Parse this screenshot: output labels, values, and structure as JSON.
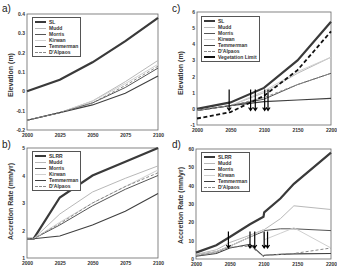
{
  "chart_data": [
    {
      "panel": "a)",
      "type": "line",
      "ylabel": "Elevation (m)",
      "xlim": [
        2000,
        2100
      ],
      "ylim": [
        -0.2,
        0.4
      ],
      "xticks": [
        "2000",
        "2025",
        "2050",
        "2075",
        "2100"
      ],
      "yticks": [
        "0.4",
        "0.3",
        "0.2",
        "0.1",
        "0",
        "-0.1",
        "-0.2"
      ],
      "legend": [
        "SL",
        "Mudd",
        "Morris",
        "Kirwan",
        "Temmerman",
        "D'Alpaos"
      ],
      "x": [
        2000,
        2025,
        2050,
        2075,
        2100
      ],
      "series": [
        {
          "name": "SL",
          "values": [
            0.0,
            0.06,
            0.15,
            0.26,
            0.38
          ]
        },
        {
          "name": "Mudd",
          "values": [
            -0.15,
            -0.11,
            -0.05,
            0.05,
            0.16
          ]
        },
        {
          "name": "Morris",
          "values": [
            -0.15,
            -0.11,
            -0.06,
            0.02,
            0.12
          ]
        },
        {
          "name": "Kirwan",
          "values": [
            -0.15,
            -0.11,
            -0.05,
            0.04,
            0.14
          ]
        },
        {
          "name": "Temmerman",
          "values": [
            -0.15,
            -0.11,
            -0.07,
            -0.01,
            0.08
          ]
        },
        {
          "name": "D'Alpaos",
          "values": [
            -0.15,
            -0.11,
            -0.06,
            0.03,
            0.13
          ]
        }
      ]
    },
    {
      "panel": "b)",
      "type": "line",
      "ylabel": "Accretion Rate (mm/yr)",
      "xlim": [
        2000,
        2100
      ],
      "ylim": [
        1,
        5
      ],
      "xticks": [
        "2000",
        "2025",
        "2050",
        "2075",
        "2100"
      ],
      "yticks": [
        "5",
        "4",
        "3",
        "2",
        "1"
      ],
      "legend": [
        "SLRR",
        "Mudd",
        "Morris",
        "Kirwan",
        "Temmerman",
        "D'Alpaos"
      ],
      "x": [
        2000,
        2005,
        2025,
        2050,
        2075,
        2100
      ],
      "series": [
        {
          "name": "SLRR",
          "values": [
            1.7,
            1.7,
            3.2,
            4.0,
            4.5,
            5.0
          ]
        },
        {
          "name": "Mudd",
          "values": [
            1.7,
            1.7,
            2.6,
            3.4,
            3.9,
            4.35
          ]
        },
        {
          "name": "Morris",
          "values": [
            1.7,
            1.7,
            2.2,
            2.9,
            3.5,
            4.0
          ]
        },
        {
          "name": "Kirwan",
          "values": [
            1.7,
            1.7,
            2.3,
            3.0,
            3.6,
            4.2
          ]
        },
        {
          "name": "Temmerman",
          "values": [
            1.7,
            1.7,
            1.8,
            2.2,
            2.7,
            3.35
          ]
        },
        {
          "name": "D'Alpaos",
          "values": [
            1.7,
            1.7,
            2.25,
            3.0,
            3.6,
            4.1
          ]
        }
      ]
    },
    {
      "panel": "c)",
      "type": "line",
      "ylabel": "Elevation (m)",
      "xlim": [
        2000,
        2200
      ],
      "ylim": [
        -1,
        6
      ],
      "xticks": [
        "2000",
        "2050",
        "2100",
        "2150",
        "2200"
      ],
      "yticks": [
        "6",
        "5",
        "4",
        "3",
        "2",
        "1",
        "0",
        "-1"
      ],
      "legend": [
        "SL",
        "Mudd",
        "Morris",
        "Kirwan",
        "Temmerman",
        "D'Alpaos",
        "Vegetation Limit"
      ],
      "x": [
        2000,
        2050,
        2100,
        2150,
        2200
      ],
      "series": [
        {
          "name": "SL",
          "values": [
            0.0,
            0.4,
            1.3,
            3.0,
            5.4
          ]
        },
        {
          "name": "Mudd",
          "values": [
            -0.1,
            0.2,
            1.0,
            2.2,
            3.2
          ]
        },
        {
          "name": "Morris",
          "values": [
            -0.1,
            0.2,
            0.6,
            1.5,
            2.2
          ]
        },
        {
          "name": "Kirwan",
          "values": [
            -0.1,
            0.2,
            1.1,
            2.3,
            3.2
          ]
        },
        {
          "name": "Temmerman",
          "values": [
            -0.1,
            0.2,
            0.45,
            0.55,
            0.65
          ]
        },
        {
          "name": "D'Alpaos",
          "values": [
            -0.1,
            0.2,
            0.7,
            1.5,
            2.2
          ]
        },
        {
          "name": "Vegetation Limit",
          "values": [
            -0.6,
            -0.2,
            0.8,
            2.4,
            4.8
          ]
        }
      ],
      "annotations": [
        "arrows near 2048, 2080, 2087, 2101, 2106"
      ]
    },
    {
      "panel": "d)",
      "type": "line",
      "ylabel": "Accretion Rate (mm/yr)",
      "xlim": [
        2000,
        2200
      ],
      "ylim": [
        0,
        60
      ],
      "xticks": [
        "2000",
        "2050",
        "2100",
        "2150",
        "2200"
      ],
      "yticks": [
        "60",
        "50",
        "40",
        "30",
        "20",
        "10",
        "0"
      ],
      "legend": [
        "SLRR",
        "Mudd",
        "Morris",
        "Kirwan",
        "Temmerman",
        "D'Alpaos"
      ],
      "x": [
        2000,
        2030,
        2050,
        2080,
        2100,
        2101,
        2125,
        2145,
        2200
      ],
      "series": [
        {
          "name": "SLRR",
          "values": [
            3.5,
            7.5,
            12,
            19,
            23,
            25.5,
            33,
            41,
            58
          ]
        },
        {
          "name": "Mudd",
          "values": [
            2.5,
            5,
            9,
            13,
            16,
            16,
            22,
            29,
            27
          ]
        },
        {
          "name": "Morris",
          "values": [
            2,
            4,
            7,
            12,
            15,
            15.5,
            16.5,
            16.5,
            15.5
          ]
        },
        {
          "name": "Kirwan",
          "values": [
            2,
            4,
            7,
            12,
            16,
            10.5,
            14,
            17,
            6
          ]
        },
        {
          "name": "Temmerman",
          "values": [
            1.5,
            3,
            6,
            8,
            1.5,
            2,
            2.5,
            2.8,
            3
          ]
        },
        {
          "name": "D'Alpaos",
          "values": [
            1.8,
            3.5,
            6.5,
            7,
            1.5,
            2,
            2.5,
            3,
            6
          ]
        }
      ],
      "annotations": [
        "arrows near 2048, 2080, 2087, 2101, 2106"
      ]
    }
  ]
}
